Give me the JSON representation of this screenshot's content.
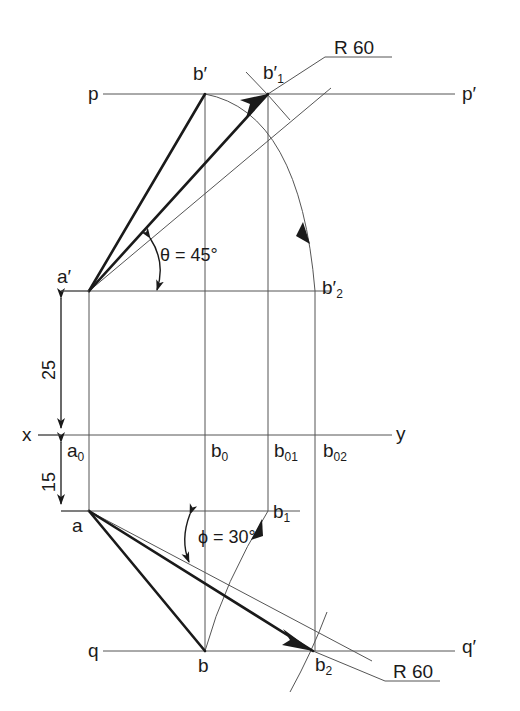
{
  "drawing": {
    "title": "Orthographic projection construction - true length of line AB",
    "type": "engineering-line-diagram",
    "colors": {
      "line": "#1a1a1a",
      "thin_line": "#555555",
      "background": "#ffffff"
    }
  },
  "labels": {
    "p_left": "p",
    "p_right": "p′",
    "q_left": "q",
    "q_right": "q′",
    "x_axis": "x",
    "y_axis": "y",
    "a_front": "a′",
    "a_top": "a",
    "a0": {
      "base": "a",
      "sub": "0"
    },
    "b_front": "b′",
    "b_top": "b",
    "b0": {
      "base": "b",
      "sub": "0"
    },
    "b1_front": {
      "base": "b′",
      "sub": "1"
    },
    "b2_front": {
      "base": "b′",
      "sub": "2"
    },
    "b1_top": {
      "base": "b",
      "sub": "1"
    },
    "b2_top": {
      "base": "b",
      "sub": "2"
    },
    "b01": {
      "base": "b",
      "sub": "01"
    },
    "b02": {
      "base": "b",
      "sub": "02"
    },
    "radius_top": "R 60",
    "radius_bottom": "R 60",
    "angle_theta": "θ = 45°",
    "angle_phi": "ϕ = 30°",
    "dim_25": "25",
    "dim_15": "15"
  },
  "dimensions": {
    "above_xy": 25,
    "below_xy": 15,
    "radius": 60,
    "theta_deg": 45,
    "phi_deg": 30,
    "units": "mm"
  },
  "geometry": {
    "line_p_y": 94,
    "line_aprime_y": 291,
    "line_xy_y": 435,
    "line_a_y": 511,
    "line_q_y": 651,
    "x_a": 89,
    "x_b": 205,
    "x_b01": 268,
    "x_b02": 315
  }
}
